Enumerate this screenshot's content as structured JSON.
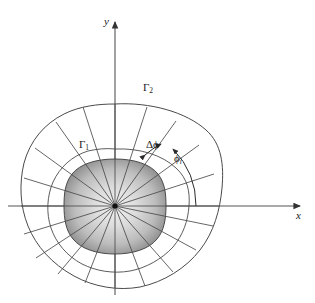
{
  "figure": {
    "axes": {
      "x_label": "x",
      "y_label": "y",
      "origin": [
        115,
        206
      ]
    },
    "labels": {
      "gamma_inner": "Γ",
      "gamma_inner_sub": "1",
      "gamma_outer": "Γ",
      "gamma_outer_sub": "2",
      "delta_phi": "Δϕ",
      "phi_i": "ϕ",
      "phi_i_sub": "i"
    },
    "colors": {
      "stroke": "#4a4a4a",
      "axis": "#555555",
      "text": "#1a1a1a",
      "shade_light": "#e8e8e8",
      "shade_mid": "#c4c4c4",
      "shade_dark": "#8f8f8f",
      "background": "#ffffff"
    },
    "geometry": {
      "sector_count": 20,
      "ring_count": 2,
      "inner_boundary": "rounded square blob, radius approx 47px",
      "outer_boundary": "irregular rounded polygon, radius 100-112px",
      "intermediate_arc": "ring between inner and outer boundary"
    }
  }
}
